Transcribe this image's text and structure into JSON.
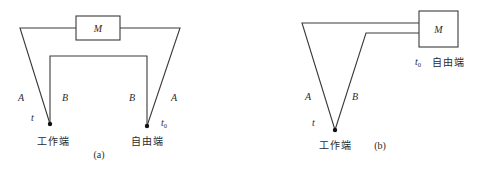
{
  "figure_a": {
    "caption": "(a)",
    "meter_label": "M",
    "conductor_outer_left": "A",
    "conductor_inner_left": "B",
    "conductor_inner_right": "B",
    "conductor_outer_right": "A",
    "hot_temp": "t",
    "cold_temp_base": "t",
    "cold_temp_sub": "0",
    "working_end": "工作端",
    "free_end": "自由端"
  },
  "figure_b": {
    "caption": "(b)",
    "meter_label": "M",
    "conductor_left": "A",
    "conductor_right": "B",
    "hot_temp": "t",
    "cold_temp_base": "t",
    "cold_temp_sub": "0",
    "working_end": "工作端",
    "free_end": "自由端"
  }
}
